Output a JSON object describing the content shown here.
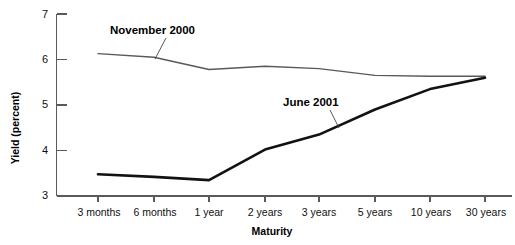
{
  "chart_data": {
    "type": "line",
    "title": "",
    "xlabel": "Maturity",
    "ylabel": "Yield (percent)",
    "categories": [
      "3 months",
      "6 months",
      "1 year",
      "2 years",
      "3 years",
      "5 years",
      "10 years",
      "30 years"
    ],
    "ylim": [
      3,
      7
    ],
    "yticks": [
      3,
      4,
      5,
      6,
      7
    ],
    "ytick_labels": [
      "3",
      "4",
      "5",
      "6",
      "7"
    ],
    "grid": false,
    "legend_position": "inline-annotation",
    "series": [
      {
        "name": "November 2000",
        "color": "#595959",
        "values": [
          6.13,
          6.05,
          5.78,
          5.85,
          5.8,
          5.65,
          5.63,
          5.63
        ],
        "label_text": "November 2000"
      },
      {
        "name": "June 2001",
        "color": "#121212",
        "values": [
          3.48,
          3.42,
          3.35,
          4.02,
          4.35,
          4.9,
          5.35,
          5.6
        ],
        "label_text": "June 2001"
      }
    ],
    "annotations": [
      {
        "text": "November 2000",
        "target_series": "November 2000",
        "target_category": "6 months"
      },
      {
        "text": "June 2001",
        "target_series": "June 2001",
        "target_category": "3 years"
      }
    ]
  },
  "axes": {
    "y_label": "Yield (percent)",
    "x_label": "Maturity",
    "y_tick_0": "3",
    "y_tick_1": "4",
    "y_tick_2": "5",
    "y_tick_3": "6",
    "y_tick_4": "7",
    "x_tick_0": "3 months",
    "x_tick_1": "6 months",
    "x_tick_2": "1 year",
    "x_tick_3": "2 years",
    "x_tick_4": "3 years",
    "x_tick_5": "5 years",
    "x_tick_6": "10 years",
    "x_tick_7": "30 years"
  },
  "labels": {
    "november": "November 2000",
    "june": "June 2001"
  },
  "colors": {
    "november_line": "#595959",
    "june_line": "#121212",
    "axis": "#5a5a5a",
    "text": "#111111",
    "background": "#ffffff"
  }
}
